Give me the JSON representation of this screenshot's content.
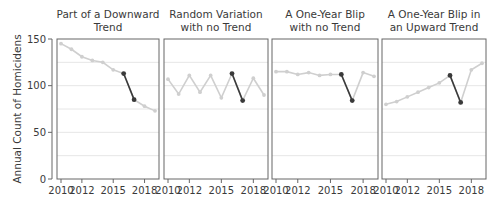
{
  "chart_data": {
    "type": "line",
    "ylabel": "Annual Count of Homicidens",
    "ylim": [
      0,
      150
    ],
    "yticks": [
      0,
      50,
      100,
      150
    ],
    "grid_y": [
      25,
      50,
      75,
      100,
      125
    ],
    "x": [
      2010,
      2011,
      2012,
      2013,
      2014,
      2015,
      2016,
      2017,
      2018,
      2019
    ],
    "xticks": [
      2010,
      2012,
      2015,
      2018
    ],
    "xtick_labels": [
      "2010",
      "2012",
      "2015",
      "2018"
    ],
    "highlight_segment": [
      2016,
      2017
    ],
    "colors": {
      "base_line": "#cfcfcf",
      "highlight_line": "#3a3a3a",
      "grid": "#e6e6e6",
      "frame": "#666666"
    },
    "panels": [
      {
        "title": [
          "Part of a Downward",
          "Trend"
        ],
        "values": [
          145,
          139,
          131,
          127,
          125,
          117,
          113,
          85,
          78,
          73
        ]
      },
      {
        "title": [
          "Random Variation",
          "with no Trend"
        ],
        "values": [
          107,
          91,
          111,
          93,
          111,
          87,
          113,
          84,
          108,
          90
        ]
      },
      {
        "title": [
          "A One-Year Blip",
          "with no Trend"
        ],
        "values": [
          115,
          115,
          112,
          114,
          111,
          112,
          112,
          84,
          114,
          110
        ]
      },
      {
        "title": [
          "A One-Year Blip in",
          "an Upward Trend"
        ],
        "values": [
          80,
          83,
          88,
          93,
          98,
          103,
          111,
          82,
          117,
          124
        ]
      }
    ]
  }
}
